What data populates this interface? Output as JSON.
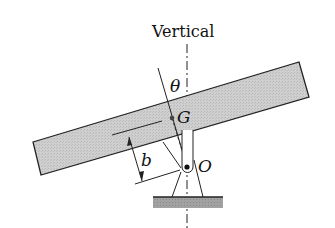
{
  "diagram": {
    "labels": {
      "vertical": "Vertical",
      "theta": "θ",
      "g": "G",
      "b": "b",
      "o": "O"
    },
    "colors": {
      "bar_fill": "#c8c8c8",
      "ground_fill": "#9a9a9a",
      "stroke": "#222222"
    }
  }
}
